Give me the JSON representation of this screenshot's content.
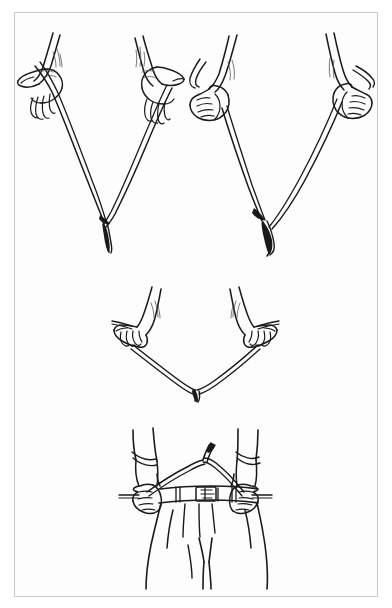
{
  "figure": {
    "kind": "line-art-illustration",
    "title": "",
    "caption": "",
    "style": "black ink line drawing on white paper",
    "colors": {
      "page_background": "#ffffff",
      "plate_background": "#fdfdfd",
      "frame_border": "#c9c9c9",
      "ink": "#1a1a1a",
      "shading_hatch": "#555555"
    },
    "frame": {
      "x": 14,
      "y": 12,
      "width": 364,
      "height": 585
    }
  },
  "panels": [
    {
      "id": "panel-top-left",
      "label": "",
      "description": "Pair of hands holding a forked Y-rod with palms up, thumbs outward, rod tips gripped between thumb and fingers; the fork stem hangs downward at the vertex",
      "grip": "palms-up thumbs-out grip",
      "hands": [
        {
          "id": "hand-top-left-left",
          "side": "left",
          "orientation": "palm-up"
        },
        {
          "id": "hand-top-left-right",
          "side": "right",
          "orientation": "palm-up"
        }
      ],
      "rod": {
        "id": "rod-top-left",
        "shape": "V",
        "stem_direction": "down"
      }
    },
    {
      "id": "panel-top-right",
      "label": "",
      "description": "Pair of closed fists gripping the forked Y-rod from above, knuckles forward, rod tips protruding from the fists; the fork stem hangs downward at the vertex",
      "grip": "closed-fist overhand grip",
      "hands": [
        {
          "id": "hand-top-right-left",
          "side": "left",
          "orientation": "fist"
        },
        {
          "id": "hand-top-right-right",
          "side": "right",
          "orientation": "fist"
        }
      ],
      "rod": {
        "id": "rod-top-right",
        "shape": "V",
        "stem_direction": "down"
      }
    },
    {
      "id": "panel-middle",
      "label": "",
      "description": "Close view of two hands with fingers curled over the rod branches, wrists rotated inward, short rod tips projecting outward past each fist; the fork stem points downward",
      "grip": "fingers-over-rod grip, wrists rotated inward",
      "hands": [
        {
          "id": "hand-middle-left",
          "side": "left",
          "orientation": "fingers-curled"
        },
        {
          "id": "hand-middle-right",
          "side": "right",
          "orientation": "fingers-curled"
        }
      ],
      "rod": {
        "id": "rod-middle",
        "shape": "V",
        "stem_direction": "down"
      }
    },
    {
      "id": "panel-bottom",
      "label": "",
      "description": "Front view of a dowser's torso from mid-forearm to thigh, sleeves rolled up, wearing a belted pair of trousers with belt loops and a rectangular buckle; both fists hold the rod tips at the waist with the fork stem angled upward and forward",
      "grip": "rod held at waist, fork stem pointing up and forward",
      "hands": [
        {
          "id": "hand-bottom-left",
          "side": "left",
          "orientation": "fist"
        },
        {
          "id": "hand-bottom-right",
          "side": "right",
          "orientation": "fist"
        }
      ],
      "rod": {
        "id": "rod-bottom",
        "shape": "V",
        "stem_direction": "up"
      },
      "body_parts": [
        "left-forearm",
        "right-forearm",
        "rolled-sleeve-left",
        "rolled-sleeve-right",
        "waist",
        "belt",
        "belt-buckle",
        "belt-loops",
        "trousers",
        "trouser-pleats",
        "left-leg",
        "right-leg"
      ]
    }
  ]
}
